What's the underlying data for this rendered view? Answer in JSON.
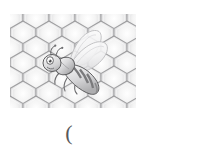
{
  "canvas": {
    "width": 201,
    "height": 151,
    "background": "#ffffff"
  },
  "illustration": {
    "name": "honeycomb-with-bee",
    "alt_text": "Grayscale honeycomb pattern with a cartoon bee",
    "bounds": {
      "x": 10,
      "y": 14,
      "width": 126,
      "height": 94
    },
    "honeycomb": {
      "cell_width": 26,
      "cell_height": 30,
      "rows": 4,
      "columns": 6,
      "cell_fill_center": "#fdfdfd",
      "cell_fill_edge": "#d5d5d6",
      "cell_stroke": "#8e8e90",
      "background": "#f3f3f3"
    },
    "bee": {
      "name": "cartoon-bee",
      "orientation": "facing-left",
      "body_light": "#f2f2f2",
      "body_mid": "#c9c9cb",
      "stripe_dark": "#7c7c7e",
      "outline": "#58585a",
      "wing_fill": "#fbfbfb",
      "wing_stroke": "#b8b8ba",
      "eye_fill": "#ffffff",
      "eye_pupil": "#4a4a4c"
    }
  },
  "caption": {
    "text": "(",
    "color": "#58585a"
  }
}
